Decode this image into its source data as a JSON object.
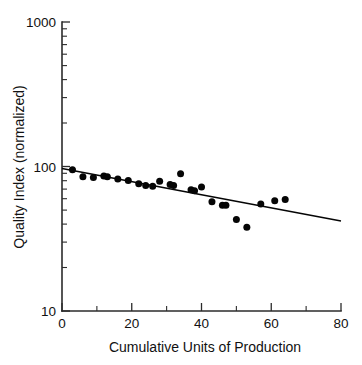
{
  "chart_data": {
    "type": "scatter",
    "title": "",
    "xlabel": "Cumulative Units of Production",
    "ylabel": "Quality Index (normalized)",
    "xlim": [
      0,
      80
    ],
    "ylim": [
      10,
      1000
    ],
    "yscale": "log",
    "xscale": "linear",
    "grid": false,
    "legend": null,
    "x_ticks": [
      0,
      20,
      40,
      60,
      80
    ],
    "x_tick_labels": [
      "0",
      "20",
      "40",
      "60",
      "80"
    ],
    "x_minor_ticks": [
      10,
      30,
      50,
      70
    ],
    "y_ticks": [
      10,
      100,
      1000
    ],
    "y_tick_labels": [
      "10",
      "100",
      "1000"
    ],
    "y_minor_ticks": [
      20,
      30,
      40,
      50,
      60,
      70,
      80,
      90,
      200,
      300,
      400,
      500,
      600,
      700,
      800,
      900
    ],
    "series": [
      {
        "name": "Quality observations",
        "marker": "filled-circle",
        "color": "#050505",
        "points": [
          {
            "x": 3,
            "y": 95
          },
          {
            "x": 6,
            "y": 85
          },
          {
            "x": 9,
            "y": 84
          },
          {
            "x": 12,
            "y": 86
          },
          {
            "x": 13,
            "y": 85
          },
          {
            "x": 16,
            "y": 82
          },
          {
            "x": 19,
            "y": 80
          },
          {
            "x": 22,
            "y": 76
          },
          {
            "x": 24,
            "y": 74
          },
          {
            "x": 26,
            "y": 73
          },
          {
            "x": 28,
            "y": 79
          },
          {
            "x": 31,
            "y": 75
          },
          {
            "x": 32,
            "y": 74
          },
          {
            "x": 34,
            "y": 89
          },
          {
            "x": 37,
            "y": 69
          },
          {
            "x": 38,
            "y": 68
          },
          {
            "x": 40,
            "y": 72
          },
          {
            "x": 43,
            "y": 57
          },
          {
            "x": 46,
            "y": 54
          },
          {
            "x": 47,
            "y": 54
          },
          {
            "x": 50,
            "y": 43
          },
          {
            "x": 53,
            "y": 38
          },
          {
            "x": 57,
            "y": 55
          },
          {
            "x": 61,
            "y": 58
          },
          {
            "x": 64,
            "y": 59
          }
        ]
      }
    ],
    "fit_line": {
      "name": "Log-linear trend fit",
      "color": "#050505",
      "x_start": 0,
      "y_start": 97,
      "x_end": 80,
      "y_end": 42
    }
  },
  "axes": {
    "x_title": "Cumulative Units of Production",
    "y_title": "Quality Index (normalized)",
    "x_labels": [
      "0",
      "20",
      "40",
      "60",
      "80"
    ],
    "y_labels": [
      "1000",
      "100",
      "10"
    ]
  }
}
